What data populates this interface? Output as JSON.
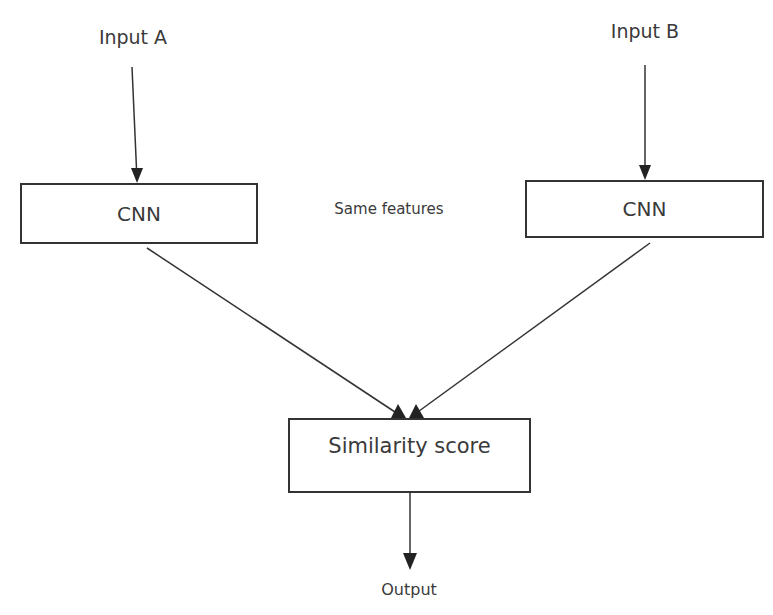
{
  "diagram": {
    "type": "siamese-network-flow",
    "nodes": {
      "input_a": {
        "label": "Input A"
      },
      "input_b": {
        "label": "Input B"
      },
      "cnn_a": {
        "label": "CNN"
      },
      "cnn_b": {
        "label": "CNN"
      },
      "similarity": {
        "label": "Similarity score"
      },
      "output": {
        "label": "Output"
      }
    },
    "annotation": {
      "label": "Same features"
    },
    "edges": [
      {
        "from": "input_a",
        "to": "cnn_a"
      },
      {
        "from": "input_b",
        "to": "cnn_b"
      },
      {
        "from": "cnn_a",
        "to": "similarity"
      },
      {
        "from": "cnn_b",
        "to": "similarity"
      },
      {
        "from": "similarity",
        "to": "output"
      }
    ]
  }
}
